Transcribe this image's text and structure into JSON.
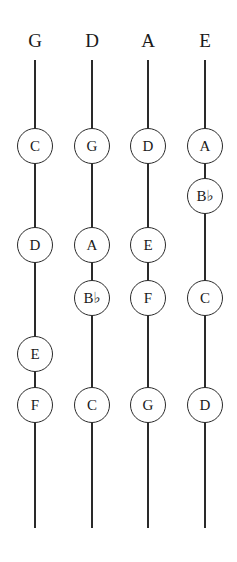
{
  "diagram": {
    "line_top": 60,
    "line_bottom": 528,
    "strings": [
      {
        "name": "G",
        "x": 35,
        "notes": [
          {
            "label": "C",
            "y": 146
          },
          {
            "label": "D",
            "y": 245
          },
          {
            "label": "E",
            "y": 354
          },
          {
            "label": "F",
            "y": 405
          }
        ]
      },
      {
        "name": "D",
        "x": 92,
        "notes": [
          {
            "label": "G",
            "y": 146
          },
          {
            "label": "A",
            "y": 245
          },
          {
            "label": "B♭",
            "y": 298
          },
          {
            "label": "C",
            "y": 405
          }
        ]
      },
      {
        "name": "A",
        "x": 148,
        "notes": [
          {
            "label": "D",
            "y": 146
          },
          {
            "label": "E",
            "y": 245
          },
          {
            "label": "F",
            "y": 298
          },
          {
            "label": "G",
            "y": 405
          }
        ]
      },
      {
        "name": "E",
        "x": 205,
        "notes": [
          {
            "label": "A",
            "y": 146
          },
          {
            "label": "B♭",
            "y": 196
          },
          {
            "label": "C",
            "y": 298
          },
          {
            "label": "D",
            "y": 405
          }
        ]
      }
    ]
  }
}
